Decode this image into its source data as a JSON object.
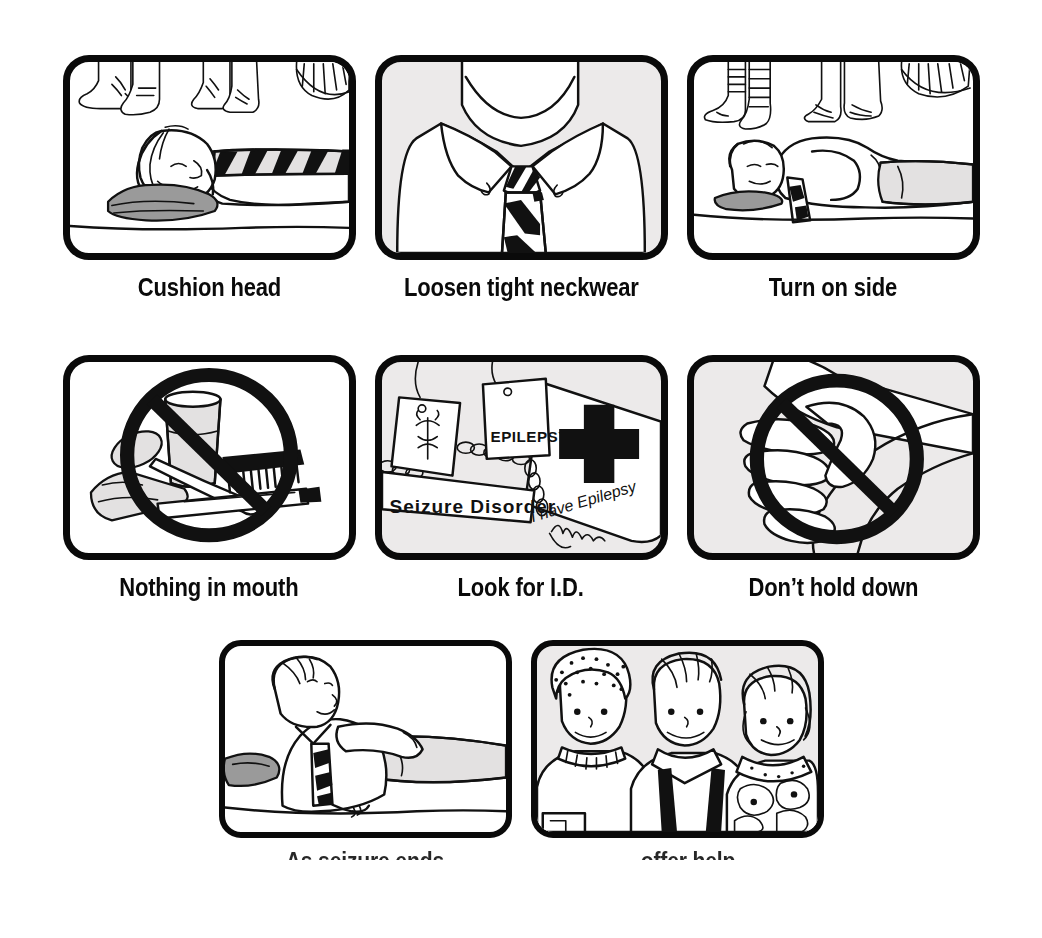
{
  "poster": {
    "title": "Seizure First Aid",
    "background_color": "#ffffff",
    "ink_color": "#111111",
    "panel_border_color": "#0a0a0a",
    "gray_fill": "#eceaea",
    "cushion_gray": "#9a9a9a"
  },
  "panels": [
    {
      "id": "cushion-head",
      "row": 1,
      "caption": "Cushion head",
      "background": "white",
      "scene": "Person lying on back on the ground with a folded gray jacket cushioning the head; bystanders' shoes visible above"
    },
    {
      "id": "loosen-tight-neckwear",
      "row": 1,
      "caption": "Loosen tight neckwear",
      "background": "gray",
      "scene": "Close-up of a shirt collar with a diagonally striped necktie knotted at the throat"
    },
    {
      "id": "turn-on-side",
      "row": 1,
      "caption": "Turn on side",
      "background": "white",
      "scene": "Person rolled onto their side on the ground, head on a gray cushion, bystanders' legs and shoes above"
    },
    {
      "id": "nothing-in-mouth",
      "row": 2,
      "caption": "Nothing in mouth",
      "background": "white",
      "scene": "Crossed-out prohibition circle over a glass of water, spoon, comb and pencil"
    },
    {
      "id": "look-for-id",
      "row": 2,
      "caption": "Look for I.D.",
      "background": "gray",
      "scene": "Medical alert identification items: dog tags, a bracelet, a medical cross and a wallet card",
      "labels": [
        "EPILEPSY",
        "Seizure Disorder",
        "I have Epilepsy"
      ]
    },
    {
      "id": "dont-hold-down",
      "row": 2,
      "caption": "Don’t hold down",
      "background": "gray",
      "scene": "Crossed-out prohibition circle over hands gripping a person's arm"
    },
    {
      "id": "as-seizure-ends",
      "row": 3,
      "caption": "As seizure ends",
      "background": "white",
      "caption_degraded": true,
      "scene": "Person sitting up propped on one elbow, alert again, gray jacket still on the ground"
    },
    {
      "id": "offer-help",
      "row": 3,
      "caption": "... offer help",
      "background": "gray",
      "caption_degraded": true,
      "scene": "Three friendly bystanders standing together looking toward the viewer"
    }
  ]
}
